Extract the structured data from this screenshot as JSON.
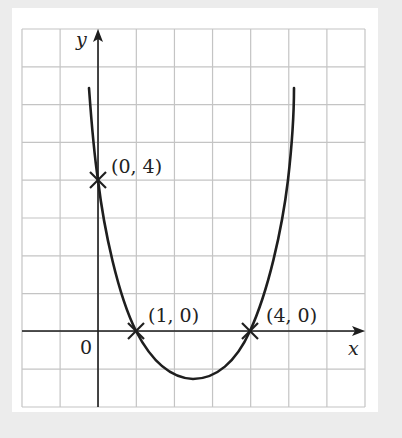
{
  "chart_data": {
    "type": "line",
    "title": "",
    "xlabel": "x",
    "ylabel": "y",
    "origin_label": "0",
    "grid": true,
    "xlim": [
      -2,
      7
    ],
    "ylim": [
      -2,
      8
    ],
    "points": [
      {
        "x": 0,
        "y": 4,
        "label": "(0, 4)"
      },
      {
        "x": 1,
        "y": 0,
        "label": "(1, 0)"
      },
      {
        "x": 4,
        "y": 0,
        "label": "(4, 0)"
      }
    ],
    "curve": {
      "description": "U-shaped curve through (0,4), (1,0), (4,0) with minimum near (2.5, -1.25)",
      "x": [
        -0.25,
        0,
        0.5,
        1,
        1.5,
        2,
        2.5,
        3,
        3.5,
        4,
        4.5,
        5.2
      ],
      "y": [
        6.5,
        4,
        1.8,
        0,
        -0.8,
        -1.15,
        -1.25,
        -1.15,
        -0.8,
        0,
        1.6,
        6.5
      ]
    }
  },
  "colors": {
    "background": "#ececec",
    "panel": "#ffffff",
    "grid": "#c4c4c4",
    "ink": "#1e1e1e"
  }
}
